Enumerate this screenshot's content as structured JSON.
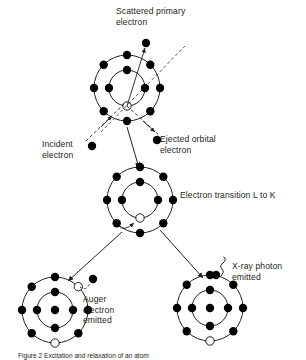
{
  "figure": {
    "caption": "Figure 2 Excitation and relaxation of an atom",
    "background_color": "#ffffff",
    "ink_color": "#231f20"
  },
  "labels": {
    "scattered_primary_electron": "Scattered primary\nelectron",
    "incident_electron": "Incident\nelectron",
    "ejected_orbital_electron": "Ejected orbital\nelectron",
    "electron_transition": "Electron transition L to K",
    "auger_electron_emitted": "Auger\nelectron\nemitted",
    "xray_photon_emitted": "X-ray photon\nemitted"
  },
  "atoms": [
    {
      "id": "atom-top",
      "role": "ionisation",
      "center": {
        "x": 127,
        "y": 88
      },
      "shells": [
        {
          "name": "K-shell",
          "radius": 18,
          "filled_electrons": 4,
          "vacancies": 1
        },
        {
          "name": "L-shell",
          "radius": 33,
          "filled_electrons": 8,
          "vacancies": 0
        }
      ]
    },
    {
      "id": "atom-middle",
      "role": "relaxation",
      "center": {
        "x": 140,
        "y": 200
      },
      "shells": [
        {
          "name": "K-shell",
          "radius": 18,
          "filled_electrons": 4,
          "vacancies": 1
        },
        {
          "name": "L-shell",
          "radius": 33,
          "filled_electrons": 8,
          "vacancies": 0
        }
      ]
    },
    {
      "id": "atom-bottom-left",
      "role": "auger-emission",
      "center": {
        "x": 55,
        "y": 310
      },
      "shells": [
        {
          "name": "K-shell",
          "radius": 18,
          "filled_electrons": 4,
          "vacancies": 0
        },
        {
          "name": "L-shell",
          "radius": 33,
          "filled_electrons": 6,
          "vacancies": 2
        }
      ]
    },
    {
      "id": "atom-bottom-right",
      "role": "xray-emission",
      "center": {
        "x": 210,
        "y": 308
      },
      "shells": [
        {
          "name": "K-shell",
          "radius": 18,
          "filled_electrons": 4,
          "vacancies": 0
        },
        {
          "name": "L-shell",
          "radius": 33,
          "filled_electrons": 7,
          "vacancies": 1
        }
      ]
    }
  ],
  "particles": {
    "incident_electron": {
      "x": 92,
      "y": 146
    },
    "scattered_primary_electron": {
      "x": 146,
      "y": 43
    },
    "ejected_orbital_electron": {
      "x": 157,
      "y": 140
    },
    "auger_electron": {
      "x": 93,
      "y": 279
    },
    "xray_emitted_electron": {
      "x": 216,
      "y": 275
    }
  },
  "legend_symbols": {
    "filled_circle": "occupied electron",
    "hollow_circle": "electron vacancy",
    "dashed_arrow": "free electron path",
    "solid_arrow": "process sequence",
    "wavy_line": "x-ray photon"
  }
}
